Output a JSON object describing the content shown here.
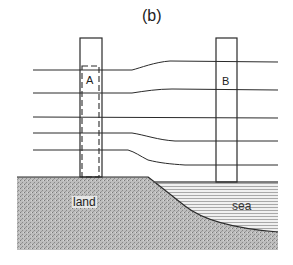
{
  "figure": {
    "title": "(b)",
    "labels": {
      "column_a": "A",
      "column_b": "B",
      "land": "land",
      "sea": "sea"
    },
    "colors": {
      "line": "#2a2a2a",
      "land_fill": "#b8b8b8",
      "sea_fill": "#e8e8e8",
      "sea_hatch": "#9a9a9a",
      "background": "#ffffff"
    },
    "elements": {
      "column_a": "tall rectangle over land with dashed inner rectangle",
      "column_b": "tall rectangle over sea",
      "horizontal_lines": 5,
      "description": "Five horizontal lines pass through column A over land, bend near the coastline, and continue through column B over the sea."
    }
  }
}
